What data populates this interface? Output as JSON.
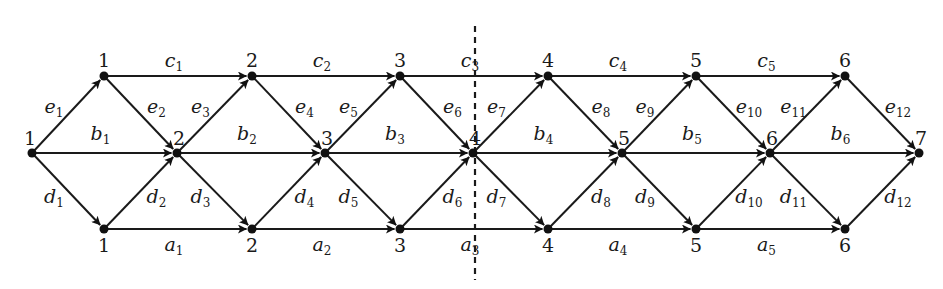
{
  "diagram": {
    "type": "layered directed graph",
    "rows": {
      "top": {
        "y": 76,
        "nodes": [
          {
            "id": "t1",
            "x": 104,
            "label": "1"
          },
          {
            "id": "t2",
            "x": 252,
            "label": "2"
          },
          {
            "id": "t3",
            "x": 400,
            "label": "3"
          },
          {
            "id": "t4",
            "x": 548,
            "label": "4"
          },
          {
            "id": "t5",
            "x": 696,
            "label": "5"
          },
          {
            "id": "t6",
            "x": 845,
            "label": "6"
          }
        ]
      },
      "middle": {
        "y": 153,
        "nodes": [
          {
            "id": "m1",
            "x": 32,
            "label": "1"
          },
          {
            "id": "m2",
            "x": 177,
            "label": "2"
          },
          {
            "id": "m3",
            "x": 325,
            "label": "3"
          },
          {
            "id": "m4",
            "x": 473,
            "label": "4"
          },
          {
            "id": "m5",
            "x": 622,
            "label": "5"
          },
          {
            "id": "m6",
            "x": 770,
            "label": "6"
          },
          {
            "id": "m7",
            "x": 919,
            "label": "7"
          }
        ]
      },
      "bottom": {
        "y": 229,
        "nodes": [
          {
            "id": "b1",
            "x": 104,
            "label": "1"
          },
          {
            "id": "b2",
            "x": 252,
            "label": "2"
          },
          {
            "id": "b3",
            "x": 400,
            "label": "3"
          },
          {
            "id": "b4",
            "x": 548,
            "label": "4"
          },
          {
            "id": "b5",
            "x": 696,
            "label": "5"
          },
          {
            "id": "b6",
            "x": 845,
            "label": "6"
          }
        ]
      }
    },
    "edges": {
      "c": [
        {
          "name": "c",
          "sub": "1",
          "from": "t1",
          "to": "t2"
        },
        {
          "name": "c",
          "sub": "2",
          "from": "t2",
          "to": "t3"
        },
        {
          "name": "c",
          "sub": "3",
          "from": "t3",
          "to": "t4"
        },
        {
          "name": "c",
          "sub": "4",
          "from": "t4",
          "to": "t5"
        },
        {
          "name": "c",
          "sub": "5",
          "from": "t5",
          "to": "t6"
        }
      ],
      "b": [
        {
          "name": "b",
          "sub": "1",
          "from": "m1",
          "to": "m2"
        },
        {
          "name": "b",
          "sub": "2",
          "from": "m2",
          "to": "m3"
        },
        {
          "name": "b",
          "sub": "3",
          "from": "m3",
          "to": "m4"
        },
        {
          "name": "b",
          "sub": "4",
          "from": "m4",
          "to": "m5"
        },
        {
          "name": "b",
          "sub": "5",
          "from": "m5",
          "to": "m6"
        },
        {
          "name": "b",
          "sub": "6",
          "from": "m6",
          "to": "m7"
        }
      ],
      "a": [
        {
          "name": "a",
          "sub": "1",
          "from": "b1",
          "to": "b2"
        },
        {
          "name": "a",
          "sub": "2",
          "from": "b2",
          "to": "b3"
        },
        {
          "name": "a",
          "sub": "3",
          "from": "b3",
          "to": "b4"
        },
        {
          "name": "a",
          "sub": "4",
          "from": "b4",
          "to": "b5"
        },
        {
          "name": "a",
          "sub": "5",
          "from": "b5",
          "to": "b6"
        }
      ],
      "e": [
        {
          "name": "e",
          "sub": "1",
          "from": "m1",
          "to": "t1"
        },
        {
          "name": "e",
          "sub": "2",
          "from": "t1",
          "to": "m2"
        },
        {
          "name": "e",
          "sub": "3",
          "from": "m2",
          "to": "t2"
        },
        {
          "name": "e",
          "sub": "4",
          "from": "t2",
          "to": "m3"
        },
        {
          "name": "e",
          "sub": "5",
          "from": "m3",
          "to": "t3"
        },
        {
          "name": "e",
          "sub": "6",
          "from": "t3",
          "to": "m4"
        },
        {
          "name": "e",
          "sub": "7",
          "from": "m4",
          "to": "t4"
        },
        {
          "name": "e",
          "sub": "8",
          "from": "t4",
          "to": "m5"
        },
        {
          "name": "e",
          "sub": "9",
          "from": "m5",
          "to": "t5"
        },
        {
          "name": "e",
          "sub": "10",
          "from": "t5",
          "to": "m6"
        },
        {
          "name": "e",
          "sub": "11",
          "from": "m6",
          "to": "t6"
        },
        {
          "name": "e",
          "sub": "12",
          "from": "t6",
          "to": "m7"
        }
      ],
      "d": [
        {
          "name": "d",
          "sub": "1",
          "from": "m1",
          "to": "b1"
        },
        {
          "name": "d",
          "sub": "2",
          "from": "b1",
          "to": "m2"
        },
        {
          "name": "d",
          "sub": "3",
          "from": "m2",
          "to": "b2"
        },
        {
          "name": "d",
          "sub": "4",
          "from": "b2",
          "to": "m3"
        },
        {
          "name": "d",
          "sub": "5",
          "from": "m3",
          "to": "b3"
        },
        {
          "name": "d",
          "sub": "6",
          "from": "b3",
          "to": "m4"
        },
        {
          "name": "d",
          "sub": "7",
          "from": "m4",
          "to": "b4"
        },
        {
          "name": "d",
          "sub": "8",
          "from": "b4",
          "to": "m5"
        },
        {
          "name": "d",
          "sub": "9",
          "from": "m5",
          "to": "b5"
        },
        {
          "name": "d",
          "sub": "10",
          "from": "b5",
          "to": "m6"
        },
        {
          "name": "d",
          "sub": "11",
          "from": "m6",
          "to": "b6"
        },
        {
          "name": "d",
          "sub": "12",
          "from": "b6",
          "to": "m7"
        }
      ]
    },
    "divider": {
      "x": 475,
      "y1": 26,
      "y2": 280,
      "style": "dashed"
    }
  }
}
